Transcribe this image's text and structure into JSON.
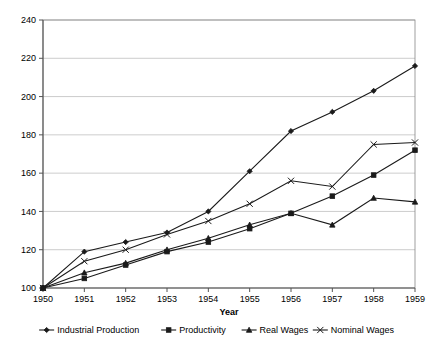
{
  "chart_data": {
    "type": "line",
    "title": "",
    "xlabel": "Year",
    "ylabel": "",
    "categories": [
      1950,
      1951,
      1952,
      1953,
      1954,
      1955,
      1956,
      1957,
      1958,
      1959
    ],
    "x": [
      "1950",
      "1951",
      "1952",
      "1953",
      "1954",
      "1955",
      "1956",
      "1957",
      "1958",
      "1959"
    ],
    "xlim": [
      1950,
      1959
    ],
    "ylim": [
      100,
      240
    ],
    "y_ticks": [
      100,
      120,
      140,
      160,
      180,
      200,
      220,
      240
    ],
    "x_ticks": [
      "1950",
      "1951",
      "1952",
      "1953",
      "1954",
      "1955",
      "1956",
      "1957",
      "1958",
      "1959"
    ],
    "grid": true,
    "legend_position": "bottom",
    "series": [
      {
        "name": "Industrial Production",
        "marker": "diamond",
        "color": "#1a1a1a",
        "values": [
          100,
          119,
          124,
          129,
          140,
          161,
          182,
          192,
          203,
          216
        ]
      },
      {
        "name": "Productivity",
        "marker": "square",
        "color": "#1a1a1a",
        "values": [
          100,
          105,
          112,
          119,
          124,
          131,
          139,
          148,
          159,
          172
        ]
      },
      {
        "name": "Real Wages",
        "marker": "triangle",
        "color": "#1a1a1a",
        "values": [
          100,
          108,
          113,
          120,
          126,
          133,
          139,
          133,
          147,
          145
        ]
      },
      {
        "name": "Nominal Wages",
        "marker": "x",
        "color": "#1a1a1a",
        "values": [
          100,
          114,
          120,
          128,
          135,
          144,
          156,
          153,
          175,
          176
        ]
      }
    ]
  },
  "legend": {
    "items": [
      {
        "label": "Industrial Production"
      },
      {
        "label": "Productivity"
      },
      {
        "label": "Real Wages"
      },
      {
        "label": "Nominal Wages"
      }
    ]
  },
  "axes": {
    "x_title": "Year"
  }
}
